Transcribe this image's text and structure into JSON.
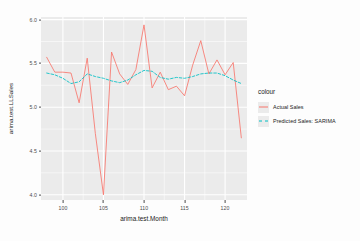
{
  "chart_data": {
    "type": "line",
    "title": "",
    "xlabel": "arima.test.Month",
    "ylabel": "arima.test.LLSales",
    "xlim": [
      97.3,
      122.7
    ],
    "ylim": [
      3.94,
      6.03
    ],
    "xticks": [
      100,
      105,
      110,
      115,
      120
    ],
    "yticks": [
      "6.0",
      "5.5",
      "5.0",
      "4.5",
      "4.0"
    ],
    "ytick_values": [
      6.0,
      5.5,
      5.0,
      4.5,
      4.0
    ],
    "grid": true,
    "legend_position": "right",
    "legend_title": "colour",
    "panel_background": "#ebebeb",
    "grid_color": "#ffffff",
    "x": [
      98,
      99,
      100,
      101,
      102,
      103,
      104,
      105,
      106,
      107,
      108,
      109,
      110,
      111,
      112,
      113,
      114,
      115,
      116,
      117,
      118,
      119,
      120,
      121,
      122
    ],
    "series": [
      {
        "name": "Actual Sales",
        "color": "#f8766d",
        "linestyle": "solid",
        "values": [
          5.57,
          5.4,
          5.4,
          5.39,
          5.05,
          5.56,
          4.7,
          4.0,
          5.63,
          5.38,
          5.26,
          5.43,
          5.94,
          5.22,
          5.4,
          5.2,
          5.24,
          5.13,
          5.48,
          5.76,
          5.38,
          5.54,
          5.37,
          5.51,
          4.65
        ]
      },
      {
        "name": "Predicted Sales: SARIMA",
        "color": "#00bfc4",
        "linestyle": "dashed",
        "values": [
          5.39,
          5.37,
          5.33,
          5.27,
          5.29,
          5.38,
          5.35,
          5.33,
          5.3,
          5.28,
          5.31,
          5.37,
          5.42,
          5.41,
          5.34,
          5.32,
          5.34,
          5.33,
          5.35,
          5.38,
          5.39,
          5.39,
          5.36,
          5.31,
          5.27
        ]
      }
    ]
  }
}
